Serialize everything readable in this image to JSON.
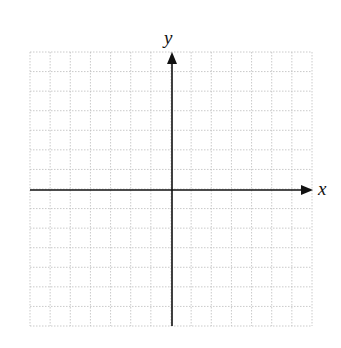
{
  "diagram": {
    "type": "coordinate-plane",
    "x_axis_label": "x",
    "y_axis_label": "y",
    "grid": {
      "columns": 14,
      "rows": 14,
      "style": "dotted",
      "color": "#bdbdbd"
    },
    "axis_color": "#111111"
  }
}
